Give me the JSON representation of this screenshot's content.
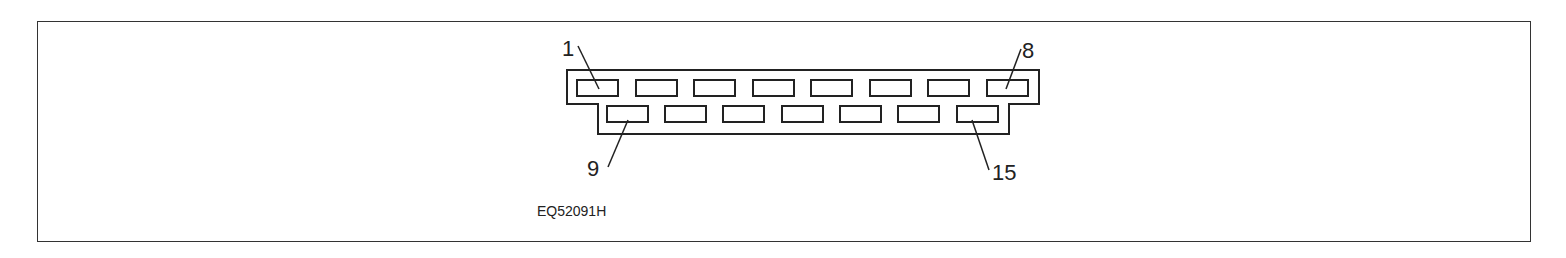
{
  "diagram": {
    "type": "connector-pinout",
    "figure_code": "EQ52091H",
    "connector": {
      "rows": 2,
      "top_row_pins": [
        1,
        2,
        3,
        4,
        5,
        6,
        7,
        8
      ],
      "bottom_row_pins": [
        9,
        10,
        11,
        12,
        13,
        14,
        15
      ],
      "total_pins": 15
    },
    "labels": {
      "pin1": "1",
      "pin8": "8",
      "pin9": "9",
      "pin15": "15"
    },
    "colors": {
      "line": "#222222",
      "background": "#ffffff"
    }
  }
}
